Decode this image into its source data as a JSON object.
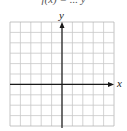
{
  "header": {
    "partial_equation_text": "f(x) = ... y"
  },
  "grid": {
    "columns": 10,
    "rows": 10,
    "left": 10,
    "top": 22,
    "cell": 10.4,
    "line_color": "#c8c8c8",
    "border_color": "#b5b5b5"
  },
  "axes": {
    "x_label": "x",
    "y_label": "y",
    "axis_color": "#1a1a1a",
    "origin_col": 5,
    "origin_row": 6
  }
}
